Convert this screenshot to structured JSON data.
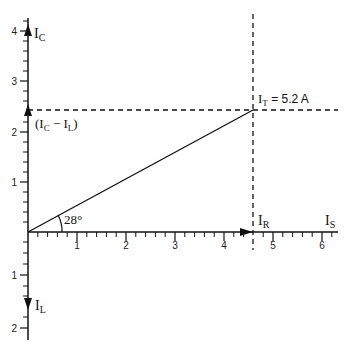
{
  "diagram": {
    "type": "phasor-diagram",
    "axes": {
      "x_ticks": [
        "1",
        "2",
        "3",
        "4",
        "5",
        "6"
      ],
      "y_up_ticks": [
        "1",
        "2",
        "3",
        "4"
      ],
      "y_down_ticks": [
        "1",
        "2"
      ],
      "x_label": "I",
      "x_label_sub": "S"
    },
    "labels": {
      "ic": {
        "main": "I",
        "sub": "C"
      },
      "il": {
        "main": "I",
        "sub": "L"
      },
      "ir": {
        "main": "I",
        "sub": "R"
      },
      "ic_minus_il": {
        "open": "(I",
        "sub1": "C",
        "mid": " − I",
        "sub2": "L",
        "close": ")"
      },
      "it": {
        "main": "I",
        "sub": "T",
        "rest": " = 5.2 A"
      },
      "angle": "28°"
    },
    "values": {
      "I_R": 4.6,
      "I_C_minus_I_L": 2.45,
      "I_T": 5.2,
      "I_C": 4.0,
      "I_L": 1.55,
      "angle_deg": 28
    },
    "colors": {
      "line": "#111111",
      "background": "#ffffff"
    }
  }
}
